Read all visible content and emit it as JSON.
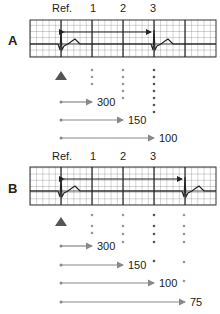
{
  "panels": [
    {
      "id": "A",
      "label": "A",
      "column_labels": [
        "Ref.",
        "1",
        "2",
        "3"
      ],
      "rate_labels": [
        "300",
        "150",
        "100"
      ],
      "rr_interval_major_boxes": 3
    },
    {
      "id": "B",
      "label": "B",
      "column_labels": [
        "Ref.",
        "1",
        "2",
        "3"
      ],
      "rate_labels": [
        "300",
        "150",
        "100",
        "75"
      ],
      "rr_interval_major_boxes": 4
    }
  ],
  "colors": {
    "grid": "#333333",
    "trace": "#333333",
    "arrow_gray": "#888888",
    "marker": "#555555",
    "dot_light": "#999999",
    "dot_dark": "#555555"
  }
}
